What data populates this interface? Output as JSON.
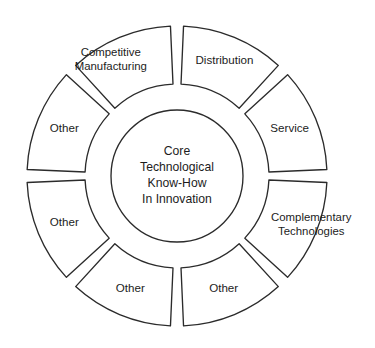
{
  "diagram": {
    "type": "donut-wheel",
    "colors": {
      "stroke": "#2b2b2b",
      "fill": "#ffffff",
      "text": "#1c1c1c",
      "background": "#ffffff"
    },
    "geometry": {
      "center_x": 177,
      "center_y": 176,
      "outer_radius": 150,
      "segment_inner_radius": 92,
      "core_radius": 66,
      "segment_count": 8,
      "gap_degrees": 5
    },
    "core": {
      "name": "core-circle",
      "lines": [
        "Core",
        "Technological",
        "Know-How",
        "In  Innovation"
      ]
    },
    "segments": [
      {
        "id": "distribution",
        "label": "Distribution",
        "lines": [
          "Distribution"
        ],
        "start_angle": 272.5,
        "end_angle": 312.5,
        "label_radius": 124,
        "overflow": "none"
      },
      {
        "id": "service",
        "label": "Service",
        "lines": [
          "Service"
        ],
        "start_angle": 317.5,
        "end_angle": 357.5,
        "label_radius": 122,
        "overflow": "none"
      },
      {
        "id": "complementary-technologies",
        "label": "Complementary Technologies",
        "lines": [
          "Complementary",
          "Technologies"
        ],
        "start_angle": 2.5,
        "end_angle": 42.5,
        "label_radius": 128,
        "overflow": "right"
      },
      {
        "id": "other-lower-right",
        "label": "Other",
        "lines": [
          "Other"
        ],
        "start_angle": 47.5,
        "end_angle": 87.5,
        "label_radius": 122,
        "overflow": "none"
      },
      {
        "id": "other-lower-left",
        "label": "Other",
        "lines": [
          "Other"
        ],
        "start_angle": 92.5,
        "end_angle": 132.5,
        "label_radius": 122,
        "overflow": "none"
      },
      {
        "id": "other-left-lower",
        "label": "Other",
        "lines": [
          "Other"
        ],
        "start_angle": 137.5,
        "end_angle": 177.5,
        "label_radius": 122,
        "overflow": "none"
      },
      {
        "id": "other-left-upper",
        "label": "Other",
        "lines": [
          "Other"
        ],
        "start_angle": 182.5,
        "end_angle": 222.5,
        "label_radius": 122,
        "overflow": "none"
      },
      {
        "id": "competitive-manufacturing",
        "label": "Competitive Manufacturing",
        "lines": [
          "Competitive",
          "Manufacturing"
        ],
        "start_angle": 227.5,
        "end_angle": 267.5,
        "label_radius": 126,
        "overflow": "left"
      }
    ]
  }
}
